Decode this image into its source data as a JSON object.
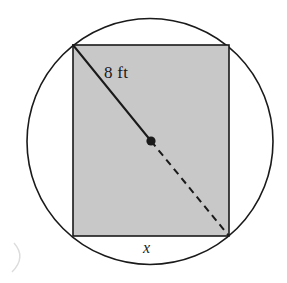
{
  "figure": {
    "kind": "geometry-diagram",
    "canvas": {
      "width": 287,
      "height": 283,
      "background": "#ffffff"
    },
    "labels": {
      "diagonal": "8 ft",
      "base": "x"
    },
    "circle": {
      "cx": 150,
      "cy": 141.5,
      "r": 123,
      "stroke": "#1a1a1a",
      "stroke_width": 1.6,
      "fill": "none"
    },
    "rectangle": {
      "x": 73,
      "y": 45,
      "width": 156,
      "height": 191,
      "fill": "#c8c8c8",
      "stroke": "#1a1a1a",
      "stroke_width": 1.6
    },
    "diagonal_solid": {
      "x1": 73,
      "y1": 45,
      "x2": 151,
      "y2": 141,
      "stroke": "#1a1a1a",
      "stroke_width": 2
    },
    "diagonal_dashed": {
      "x1": 151,
      "y1": 141,
      "x2": 229,
      "y2": 236,
      "stroke": "#1a1a1a",
      "stroke_width": 2,
      "dash": "7 5"
    },
    "center_point": {
      "cx": 151,
      "cy": 141,
      "r": 4.6,
      "fill": "#1a1a1a"
    },
    "scan_artifact": {
      "path": "M14 243 C 22 252, 22 262, 12 272",
      "stroke": "#d9d9d9",
      "stroke_width": 1.4
    }
  }
}
